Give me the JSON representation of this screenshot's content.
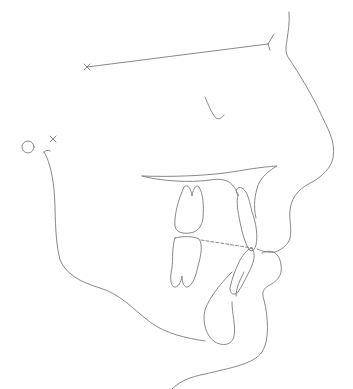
{
  "diagram": {
    "type": "cephalometric-tracing",
    "view": "lateral profile",
    "background": "#ffffff",
    "stroke_color": "#7a7a7a",
    "stroke_width": 0.9,
    "landmarks": [
      {
        "name": "sella-x",
        "symbol": "x",
        "x": 87,
        "y": 67
      },
      {
        "name": "nasion",
        "symbol": "y-junction",
        "x": 268,
        "y": 44
      },
      {
        "name": "porion-circle",
        "symbol": "circle",
        "x": 28,
        "y": 147
      },
      {
        "name": "condylion-x",
        "symbol": "x",
        "x": 53,
        "y": 139
      }
    ],
    "structures": [
      "sella-nasion line",
      "soft tissue profile (forehead, nose, lips, chin)",
      "orbit",
      "palatal plane",
      "upper molar",
      "lower molar",
      "upper incisor",
      "lower incisor",
      "symphysis",
      "mandible border",
      "occlusal plane (dashed)"
    ]
  }
}
